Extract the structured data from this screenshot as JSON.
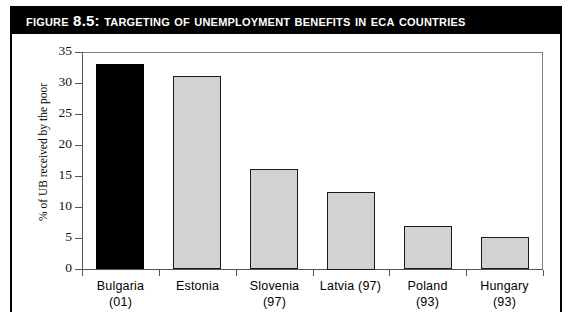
{
  "figure": {
    "title": "Figure 8.5: Targeting of Unemployment Benefits in ECA Countries",
    "border_color": "#000000",
    "title_bar_color": "#000000",
    "title_text_color": "#ffffff"
  },
  "chart_data": {
    "type": "bar",
    "title": "Figure 8.5: Targeting of Unemployment Benefits in ECA Countries",
    "xlabel": "",
    "ylabel": "% of UB received by the poor",
    "categories": [
      "Bulgaria (01)",
      "Estonia",
      "Slovenia (97)",
      "Latvia (97)",
      "Poland (93)",
      "Hungary (93)"
    ],
    "category_lines": [
      [
        "Bulgaria",
        "(01)"
      ],
      [
        "Estonia",
        ""
      ],
      [
        "Slovenia",
        "(97)"
      ],
      [
        "Latvia (97)",
        ""
      ],
      [
        "Poland",
        "(93)"
      ],
      [
        "Hungary",
        "(93)"
      ]
    ],
    "values": [
      33.0,
      31.2,
      16.1,
      12.5,
      7.0,
      5.1
    ],
    "bar_colors": [
      "#000000",
      "#d2d2d2",
      "#d2d2d2",
      "#d2d2d2",
      "#d2d2d2",
      "#d2d2d2"
    ],
    "ylim": [
      0,
      35
    ],
    "yticks": [
      0,
      5,
      10,
      15,
      20,
      25,
      30,
      35
    ],
    "ytick_labels": [
      "0",
      "5",
      "10",
      "15",
      "20",
      "25",
      "30",
      "35"
    ],
    "grid": false,
    "legend": null
  }
}
